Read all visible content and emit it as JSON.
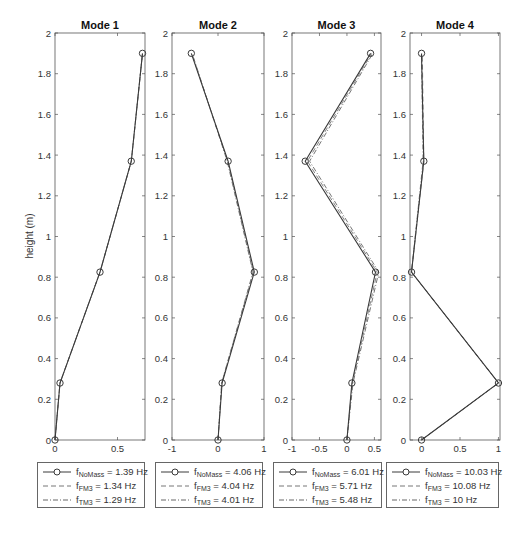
{
  "figure": {
    "ylabel": "height (m)",
    "y_ticks": [
      "0",
      "0.2",
      "0.4",
      "0.6",
      "0.8",
      "1",
      "1.2",
      "1.4",
      "1.6",
      "1.8",
      "2"
    ]
  },
  "panels": [
    {
      "title": "Mode 1",
      "legend": [
        {
          "sym": "f",
          "sub": "NoMass",
          "text": " = 1.39 Hz",
          "style": "solid-circle"
        },
        {
          "sym": "f",
          "sub": "FM3",
          "text": " = 1.34 Hz",
          "style": "dashed"
        },
        {
          "sym": "f",
          "sub": "TM3",
          "text": " = 1.29 Hz",
          "style": "dashdot"
        }
      ]
    },
    {
      "title": "Mode 2",
      "legend": [
        {
          "sym": "f",
          "sub": "NoMass",
          "text": " = 4.06 Hz",
          "style": "solid-circle"
        },
        {
          "sym": "f",
          "sub": "FM3",
          "text": " = 4.04 Hz",
          "style": "dashed"
        },
        {
          "sym": "f",
          "sub": "TM3",
          "text": " = 4.01 Hz",
          "style": "dashdot"
        }
      ]
    },
    {
      "title": "Mode 3",
      "legend": [
        {
          "sym": "f",
          "sub": "NoMass",
          "text": " = 6.01 Hz",
          "style": "solid-circle"
        },
        {
          "sym": "f",
          "sub": "FM3",
          "text": " = 5.71 Hz",
          "style": "dashed"
        },
        {
          "sym": "f",
          "sub": "TM3",
          "text": " = 5.48 Hz",
          "style": "dashdot"
        }
      ]
    },
    {
      "title": "Mode 4",
      "legend": [
        {
          "sym": "f",
          "sub": "NoMass",
          "text": " = 10.03 Hz",
          "style": "solid-circle"
        },
        {
          "sym": "f",
          "sub": "FM3",
          "text": " = 10.08 Hz",
          "style": "dashed"
        },
        {
          "sym": "f",
          "sub": "TM3",
          "text": " = 10 Hz",
          "style": "dashdot"
        }
      ]
    }
  ],
  "chart_data": [
    {
      "type": "line",
      "title": "Mode 1",
      "xlabel": "",
      "ylabel": "height (m)",
      "xlim": [
        0,
        0.72
      ],
      "ylim": [
        0,
        2
      ],
      "x_ticks": [
        0,
        0.5
      ],
      "x_tick_labels": [
        "0",
        "0.5"
      ],
      "y": [
        0,
        0.28,
        0.825,
        1.37,
        1.9
      ],
      "series": [
        {
          "name": "f_NoMass = 1.39 Hz",
          "style": "solid-circle",
          "x": [
            0.0,
            0.04,
            0.36,
            0.61,
            0.7
          ]
        },
        {
          "name": "f_FM3 = 1.34 Hz",
          "style": "dashed",
          "x": [
            0.0,
            0.04,
            0.36,
            0.61,
            0.7
          ]
        },
        {
          "name": "f_TM3 = 1.29 Hz",
          "style": "dashdot",
          "x": [
            0.0,
            0.04,
            0.36,
            0.61,
            0.7
          ]
        }
      ],
      "grid": false,
      "legend_position": "below"
    },
    {
      "type": "line",
      "title": "Mode 2",
      "xlabel": "",
      "ylabel": "",
      "xlim": [
        -1,
        1
      ],
      "ylim": [
        0,
        2
      ],
      "x_ticks": [
        -1,
        0,
        1
      ],
      "x_tick_labels": [
        "-1",
        "0",
        "1"
      ],
      "y": [
        0,
        0.28,
        0.825,
        1.37,
        1.9
      ],
      "series": [
        {
          "name": "f_NoMass = 4.06 Hz",
          "style": "solid-circle",
          "x": [
            0.0,
            0.09,
            0.79,
            0.22,
            -0.58
          ]
        },
        {
          "name": "f_FM3 = 4.04 Hz",
          "style": "dashed",
          "x": [
            0.0,
            0.08,
            0.77,
            0.21,
            -0.57
          ]
        },
        {
          "name": "f_TM3 = 4.01 Hz",
          "style": "dashdot",
          "x": [
            0.0,
            0.08,
            0.76,
            0.2,
            -0.56
          ]
        }
      ],
      "grid": false,
      "legend_position": "below"
    },
    {
      "type": "line",
      "title": "Mode 3",
      "xlabel": "",
      "ylabel": "",
      "xlim": [
        -1,
        0.62
      ],
      "ylim": [
        0,
        2
      ],
      "x_ticks": [
        -1,
        -0.5,
        0,
        0.5
      ],
      "x_tick_labels": [
        "-1",
        "-0.5",
        "0",
        "0.5"
      ],
      "y": [
        0,
        0.28,
        0.825,
        1.37,
        1.9
      ],
      "series": [
        {
          "name": "f_NoMass = 6.01 Hz",
          "style": "solid-circle",
          "x": [
            0.0,
            0.09,
            0.52,
            -0.76,
            0.43
          ]
        },
        {
          "name": "f_FM3 = 5.71 Hz",
          "style": "dashed",
          "x": [
            0.0,
            0.1,
            0.55,
            -0.72,
            0.45
          ]
        },
        {
          "name": "f_TM3 = 5.48 Hz",
          "style": "dashdot",
          "x": [
            0.0,
            0.11,
            0.58,
            -0.68,
            0.47
          ]
        }
      ],
      "grid": false,
      "legend_position": "below"
    },
    {
      "type": "line",
      "title": "Mode 4",
      "xlabel": "",
      "ylabel": "",
      "xlim": [
        -0.15,
        1.02
      ],
      "ylim": [
        0,
        2
      ],
      "x_ticks": [
        0,
        0.5,
        1
      ],
      "x_tick_labels": [
        "0",
        "0.5",
        "1"
      ],
      "y": [
        0,
        0.28,
        0.825,
        1.37,
        1.9
      ],
      "series": [
        {
          "name": "f_NoMass = 10.03 Hz",
          "style": "solid-circle",
          "x": [
            0.0,
            1.0,
            -0.13,
            0.03,
            0.0
          ]
        },
        {
          "name": "f_FM3 = 10.08 Hz",
          "style": "dashed",
          "x": [
            0.0,
            1.0,
            -0.13,
            0.03,
            0.01
          ]
        },
        {
          "name": "f_TM3 = 10 Hz",
          "style": "dashdot",
          "x": [
            0.0,
            1.0,
            -0.13,
            0.02,
            0.0
          ]
        }
      ],
      "grid": false,
      "legend_position": "below"
    }
  ]
}
